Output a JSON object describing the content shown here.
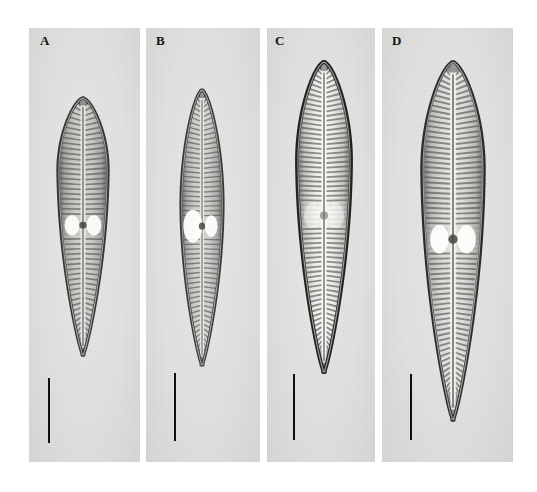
{
  "figure": {
    "type": "light-micrograph-plate",
    "background_color": "#ffffff",
    "panel_background_color": "#e3e3e1",
    "panel_count": 4,
    "width": 537,
    "height": 492
  },
  "panels": [
    {
      "label": "A",
      "label_x": 40,
      "label_y": 34,
      "x": 29,
      "y": 28,
      "w": 111,
      "h": 434,
      "specimen": {
        "name": "diatom-valve-a",
        "outline": "lanceolate, broadly rounded head pole, narrowly cuneate foot pole",
        "center_x": 83,
        "top_y": 98,
        "bottom_y": 355,
        "max_width": 50,
        "widest_at_fraction": 0.28,
        "stria_count": 52,
        "outline_darkness": 0.72,
        "interior_brightness": 0.82,
        "central_area_style": "bright lateral lacunae, dark stigma",
        "raphe": "straight, filiform, median"
      },
      "scale_bar": {
        "x": 48,
        "y_top": 378,
        "y_bottom": 443,
        "thickness": 2
      }
    },
    {
      "label": "B",
      "label_x": 156,
      "label_y": 34,
      "x": 146,
      "y": 28,
      "w": 114,
      "h": 434,
      "specimen": {
        "name": "diatom-valve-b",
        "outline": "narrow linear-lanceolate, subrostrate head pole, narrow foot pole",
        "center_x": 202,
        "top_y": 90,
        "bottom_y": 365,
        "max_width": 42,
        "widest_at_fraction": 0.42,
        "stria_count": 58,
        "outline_darkness": 0.68,
        "interior_brightness": 0.84,
        "central_area_style": "large bright asymmetric lacuna on left",
        "raphe": "straight, filiform, median"
      },
      "scale_bar": {
        "x": 174,
        "y_top": 373,
        "y_bottom": 441,
        "thickness": 2
      }
    },
    {
      "label": "C",
      "label_x": 275,
      "label_y": 34,
      "x": 267,
      "y": 28,
      "w": 108,
      "h": 434,
      "specimen": {
        "name": "diatom-valve-c",
        "outline": "lanceolate with acute head pole, elongate tapering foot pole",
        "center_x": 324,
        "top_y": 62,
        "bottom_y": 372,
        "max_width": 54,
        "widest_at_fraction": 0.32,
        "stria_count": 66,
        "outline_darkness": 0.95,
        "interior_brightness": 0.96,
        "central_area_style": "small grey stigma, faint lacunae",
        "raphe": "straight, filiform, median"
      },
      "scale_bar": {
        "x": 293,
        "y_top": 374,
        "y_bottom": 440,
        "thickness": 2
      }
    },
    {
      "label": "D",
      "label_x": 392,
      "label_y": 34,
      "x": 382,
      "y": 28,
      "w": 131,
      "h": 434,
      "specimen": {
        "name": "diatom-valve-d",
        "outline": "broadly lanceolate, acute-rostrate head pole, long cuneate foot pole",
        "center_x": 453,
        "top_y": 62,
        "bottom_y": 420,
        "max_width": 62,
        "widest_at_fraction": 0.3,
        "stria_count": 72,
        "outline_darkness": 0.8,
        "interior_brightness": 0.9,
        "central_area_style": "two bright bar-shaped lacunae flanking dark stigma",
        "raphe": "straight, filiform, median"
      },
      "scale_bar": {
        "x": 410,
        "y_top": 374,
        "y_bottom": 440,
        "thickness": 2
      }
    }
  ],
  "colors": {
    "panel_bg": "#e3e3e1",
    "page_bg": "#ffffff",
    "label_text": "#141414",
    "scale_bar": "#101010",
    "valve_outline_dark": "#1a1a1a",
    "valve_interior_light": "#f2f2f0",
    "stria_dark": "#5a5a58"
  }
}
